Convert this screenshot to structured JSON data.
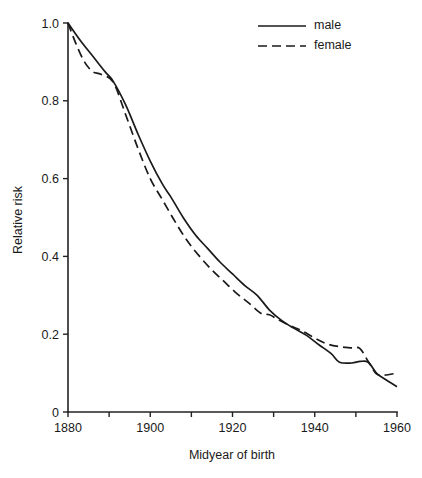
{
  "chart_data": {
    "type": "line",
    "title": "",
    "xlabel": "Midyear of birth",
    "ylabel": "Relative risk",
    "xlim": [
      1880,
      1960
    ],
    "ylim": [
      0,
      1.0
    ],
    "grid": false,
    "legend_position": "top-right",
    "x_ticks": [
      1880,
      1890,
      1900,
      1910,
      1920,
      1930,
      1940,
      1950,
      1960
    ],
    "x_tick_labels": [
      "1880",
      "",
      "1900",
      "",
      "1920",
      "",
      "1940",
      "",
      "1960"
    ],
    "y_ticks": [
      0,
      0.2,
      0.4,
      0.6,
      0.8,
      1.0
    ],
    "y_tick_labels": [
      "0",
      "0.2",
      "0.4",
      "0.6",
      "0.8",
      "1.0"
    ],
    "series": [
      {
        "name": "male",
        "style": "solid",
        "color": "#1a1a1a",
        "x": [
          1880,
          1883,
          1886,
          1889,
          1891,
          1894,
          1897,
          1900,
          1903,
          1905,
          1908,
          1911,
          1914,
          1917,
          1920,
          1923,
          1926,
          1929,
          1932,
          1935,
          1938,
          1941,
          1944,
          1946,
          1949,
          1951,
          1953,
          1955,
          1957,
          1960
        ],
        "values": [
          1.0,
          0.955,
          0.915,
          0.875,
          0.85,
          0.79,
          0.715,
          0.645,
          0.585,
          0.553,
          0.5,
          0.455,
          0.42,
          0.385,
          0.355,
          0.325,
          0.3,
          0.262,
          0.235,
          0.215,
          0.197,
          0.173,
          0.15,
          0.128,
          0.126,
          0.13,
          0.128,
          0.1,
          0.085,
          0.065
        ]
      },
      {
        "name": "female",
        "style": "dashed",
        "color": "#1a1a1a",
        "x": [
          1880,
          1882,
          1884,
          1886,
          1888,
          1891,
          1894,
          1897,
          1900,
          1903,
          1906,
          1909,
          1912,
          1915,
          1918,
          1921,
          1924,
          1927,
          1929,
          1931,
          1934,
          1937,
          1940,
          1943,
          1946,
          1949,
          1951,
          1953,
          1955,
          1957,
          1960
        ],
        "values": [
          1.0,
          0.945,
          0.9,
          0.875,
          0.868,
          0.848,
          0.765,
          0.678,
          0.6,
          0.545,
          0.49,
          0.44,
          0.4,
          0.365,
          0.335,
          0.305,
          0.28,
          0.253,
          0.25,
          0.238,
          0.222,
          0.208,
          0.19,
          0.175,
          0.168,
          0.165,
          0.163,
          0.13,
          0.098,
          0.095,
          0.1
        ]
      }
    ]
  },
  "legend": {
    "entries": [
      {
        "label": "male",
        "style": "solid"
      },
      {
        "label": "female",
        "style": "dashed"
      }
    ]
  }
}
